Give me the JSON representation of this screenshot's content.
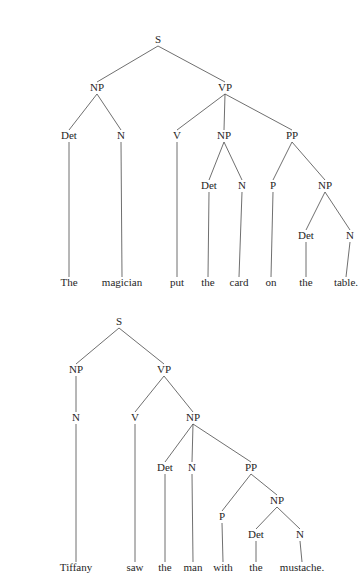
{
  "figure": {
    "kind": "syntax-tree-diagram",
    "background_color": "#ffffff",
    "line_color": "#4a4a4a",
    "text_color": "#262626"
  },
  "trees": [
    {
      "id": "tree-1",
      "sentence": "The magician put the card on the table.",
      "nodes": [
        {
          "id": "s",
          "label": "S",
          "x": 118,
          "y": 27
        },
        {
          "id": "np1",
          "label": "NP",
          "x": 57,
          "y": 75
        },
        {
          "id": "vp",
          "label": "VP",
          "x": 185,
          "y": 75
        },
        {
          "id": "det1",
          "label": "Det",
          "x": 29,
          "y": 123
        },
        {
          "id": "n1",
          "label": "N",
          "x": 81,
          "y": 123
        },
        {
          "id": "v",
          "label": "V",
          "x": 137,
          "y": 123
        },
        {
          "id": "np2",
          "label": "NP",
          "x": 184,
          "y": 123
        },
        {
          "id": "pp",
          "label": "PP",
          "x": 252,
          "y": 123
        },
        {
          "id": "det2",
          "label": "Det",
          "x": 169,
          "y": 173
        },
        {
          "id": "n2",
          "label": "N",
          "x": 202,
          "y": 173
        },
        {
          "id": "p",
          "label": "P",
          "x": 233,
          "y": 173
        },
        {
          "id": "np3",
          "label": "NP",
          "x": 285,
          "y": 173
        },
        {
          "id": "det3",
          "label": "Det",
          "x": 266,
          "y": 223
        },
        {
          "id": "n3",
          "label": "N",
          "x": 310,
          "y": 223
        }
      ],
      "leaves": [
        {
          "id": "w1",
          "label": "The",
          "x": 29,
          "y": 270,
          "parent": "det1"
        },
        {
          "id": "w2",
          "label": "magician",
          "x": 82,
          "y": 270,
          "parent": "n1"
        },
        {
          "id": "w3",
          "label": "put",
          "x": 137,
          "y": 270,
          "parent": "v"
        },
        {
          "id": "w4",
          "label": "the",
          "x": 168,
          "y": 270,
          "parent": "det2"
        },
        {
          "id": "w5",
          "label": "card",
          "x": 199,
          "y": 270,
          "parent": "n2"
        },
        {
          "id": "w6",
          "label": "on",
          "x": 231,
          "y": 270,
          "parent": "p"
        },
        {
          "id": "w7",
          "label": "the",
          "x": 266,
          "y": 270,
          "parent": "det3"
        },
        {
          "id": "w8",
          "label": "table.",
          "x": 306,
          "y": 270,
          "parent": "n3"
        }
      ],
      "edges": [
        {
          "from": "s",
          "to": "np1"
        },
        {
          "from": "s",
          "to": "vp"
        },
        {
          "from": "np1",
          "to": "det1"
        },
        {
          "from": "np1",
          "to": "n1"
        },
        {
          "from": "vp",
          "to": "v"
        },
        {
          "from": "vp",
          "to": "np2"
        },
        {
          "from": "vp",
          "to": "pp"
        },
        {
          "from": "np2",
          "to": "det2"
        },
        {
          "from": "np2",
          "to": "n2"
        },
        {
          "from": "pp",
          "to": "p"
        },
        {
          "from": "pp",
          "to": "np3"
        },
        {
          "from": "np3",
          "to": "det3"
        },
        {
          "from": "np3",
          "to": "n3"
        }
      ]
    },
    {
      "id": "tree-2",
      "sentence": "Tiffany saw the man with the mustache.",
      "nodes": [
        {
          "id": "s",
          "label": "S",
          "x": 79,
          "y": 19
        },
        {
          "id": "np1",
          "label": "NP",
          "x": 36,
          "y": 67
        },
        {
          "id": "vp",
          "label": "VP",
          "x": 124,
          "y": 67
        },
        {
          "id": "n1",
          "label": "N",
          "x": 36,
          "y": 115
        },
        {
          "id": "v",
          "label": "V",
          "x": 95,
          "y": 115
        },
        {
          "id": "np2",
          "label": "NP",
          "x": 153,
          "y": 115
        },
        {
          "id": "det1",
          "label": "Det",
          "x": 125,
          "y": 165
        },
        {
          "id": "n2",
          "label": "N",
          "x": 152,
          "y": 165
        },
        {
          "id": "pp",
          "label": "PP",
          "x": 211,
          "y": 165
        },
        {
          "id": "np3",
          "label": "NP",
          "x": 237,
          "y": 198
        },
        {
          "id": "p",
          "label": "P",
          "x": 182,
          "y": 214
        },
        {
          "id": "det2",
          "label": "Det",
          "x": 216,
          "y": 232
        },
        {
          "id": "n3",
          "label": "N",
          "x": 260,
          "y": 232
        }
      ],
      "leaves": [
        {
          "id": "w1",
          "label": "Tiffany",
          "x": 36,
          "y": 265,
          "parent": "n1"
        },
        {
          "id": "w2",
          "label": "saw",
          "x": 95,
          "y": 265,
          "parent": "v"
        },
        {
          "id": "w3",
          "label": "the",
          "x": 125,
          "y": 265,
          "parent": "det1"
        },
        {
          "id": "w4",
          "label": "man",
          "x": 153,
          "y": 265,
          "parent": "n2"
        },
        {
          "id": "w5",
          "label": "with",
          "x": 183,
          "y": 265,
          "parent": "p"
        },
        {
          "id": "w6",
          "label": "the",
          "x": 216,
          "y": 265,
          "parent": "det2"
        },
        {
          "id": "w7",
          "label": "mustache.",
          "x": 262,
          "y": 265,
          "parent": "n3"
        }
      ],
      "edges": [
        {
          "from": "s",
          "to": "np1"
        },
        {
          "from": "s",
          "to": "vp"
        },
        {
          "from": "np1",
          "to": "n1"
        },
        {
          "from": "vp",
          "to": "v"
        },
        {
          "from": "vp",
          "to": "np2"
        },
        {
          "from": "np2",
          "to": "det1"
        },
        {
          "from": "np2",
          "to": "n2"
        },
        {
          "from": "np2",
          "to": "pp"
        },
        {
          "from": "pp",
          "to": "p"
        },
        {
          "from": "pp",
          "to": "np3"
        },
        {
          "from": "np3",
          "to": "det2"
        },
        {
          "from": "np3",
          "to": "n3"
        }
      ]
    }
  ]
}
